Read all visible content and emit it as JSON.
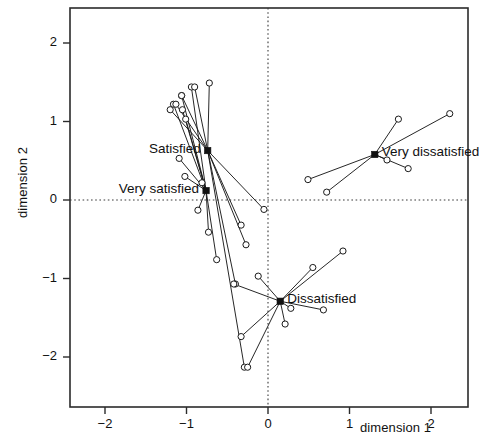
{
  "chart_data": {
    "type": "scatter",
    "title": "",
    "xlabel": "dimension 1",
    "ylabel": "dimension 2",
    "xlim": [
      -2.45,
      2.45
    ],
    "ylim": [
      -2.45,
      2.45
    ],
    "xticks": [
      -2,
      -1,
      0,
      1,
      2
    ],
    "yticks": [
      -2,
      -1,
      0,
      1,
      2
    ],
    "xticklabels": [
      "-2",
      "-1",
      "0",
      "1",
      "2"
    ],
    "yticklabels": [
      "-2",
      "-1",
      "0",
      "1",
      "2"
    ],
    "grid": false,
    "reference_lines": [
      {
        "axis": "horizontal",
        "value": 0,
        "style": "dotted"
      },
      {
        "axis": "vertical",
        "value": 0,
        "style": "dotted"
      }
    ],
    "legend": "none",
    "marker": "open-circle",
    "centroid_marker": "filled-square",
    "note": "Star / spider plot: each labelled centroid is joined by straight segments to its member points.",
    "groups": [
      {
        "name": "Very satisfied",
        "label": "Very satisfied",
        "label_anchor": "right",
        "centroid": [
          -0.76,
          0.12
        ],
        "points": [
          [
            -1.01,
            1.03
          ],
          [
            -1.16,
            1.22
          ],
          [
            -1.06,
            1.33
          ],
          [
            -0.94,
            1.44
          ],
          [
            -1.05,
            1.15
          ],
          [
            -1.09,
            0.53
          ],
          [
            -1.02,
            0.3
          ],
          [
            -0.81,
            0.22
          ],
          [
            -0.86,
            -0.13
          ],
          [
            -0.73,
            -0.41
          ],
          [
            -0.63,
            -0.76
          ]
        ]
      },
      {
        "name": "Satisfied",
        "label": "Satisfied",
        "label_anchor": "right",
        "centroid": [
          -0.74,
          0.63
        ],
        "points": [
          [
            -0.72,
            1.49
          ],
          [
            -0.33,
            -0.32
          ],
          [
            -0.05,
            -0.12
          ],
          [
            -0.27,
            -0.57
          ],
          [
            -0.4,
            -1.07
          ],
          [
            -0.29,
            -2.13
          ],
          [
            -0.9,
            1.44
          ],
          [
            -1.06,
            1.33
          ],
          [
            -1.13,
            1.22
          ],
          [
            -1.2,
            1.15
          ]
        ]
      },
      {
        "name": "Very dissatisfied",
        "label": "Very dissatisfied",
        "label_anchor": "left",
        "centroid": [
          1.31,
          0.58
        ],
        "points": [
          [
            2.23,
            1.1
          ],
          [
            1.6,
            1.03
          ],
          [
            1.46,
            0.51
          ],
          [
            1.72,
            0.4
          ],
          [
            0.49,
            0.26
          ],
          [
            0.72,
            0.1
          ]
        ]
      },
      {
        "name": "Dissatisfied",
        "label": "Dissatisfied",
        "label_anchor": "left",
        "centroid": [
          0.15,
          -1.29
        ],
        "points": [
          [
            0.92,
            -0.65
          ],
          [
            0.55,
            -0.86
          ],
          [
            -0.42,
            -1.07
          ],
          [
            0.28,
            -1.38
          ],
          [
            0.68,
            -1.4
          ],
          [
            0.21,
            -1.58
          ],
          [
            -0.33,
            -1.74
          ],
          [
            -0.25,
            -2.13
          ],
          [
            -0.12,
            -0.97
          ]
        ]
      }
    ]
  },
  "axes": {
    "x_title": "dimension 1",
    "y_title": "dimension 2"
  }
}
